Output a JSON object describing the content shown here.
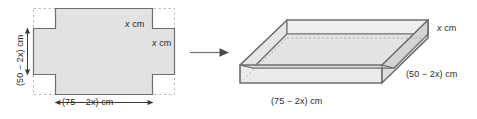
{
  "figure": {
    "colors": {
      "fill": "#e2e2e2",
      "fill_light": "#ebebeb",
      "fill_dark": "#d6d6d6",
      "stroke": "#6e6e6e",
      "dashed": "#b9b9b9",
      "text": "#2b2b2b",
      "arrow": "#555555"
    },
    "net": {
      "name": "cross-shaped-net",
      "label_height": "(50 − 2x) cm",
      "label_height_plain": "(50 - 2x) cm",
      "label_width": "(75 − 2x) cm",
      "label_width_plain": "(75 - 2x) cm",
      "label_corner_top": "x cm",
      "label_corner_right": "x cm"
    },
    "transform_arrow": {
      "name": "transform-arrow",
      "direction": "right"
    },
    "box": {
      "name": "open-box-diagram",
      "label_height": "x cm",
      "label_depth": "(50 − 2x) cm",
      "label_depth_plain": "(50 - 2x) cm",
      "label_width": "(75 − 2x) cm",
      "label_width_plain": "(75 - 2x) cm"
    }
  }
}
